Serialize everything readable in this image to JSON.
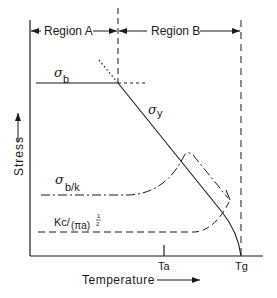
{
  "diagram": {
    "type": "stress-temperature schematic",
    "regions": [
      {
        "label": "Region A"
      },
      {
        "label": "Region B"
      }
    ],
    "axes": {
      "y_label": "Stress",
      "x_label": "Temperature",
      "x_ticks": [
        "Ta",
        "Tg"
      ]
    },
    "curves": [
      {
        "id": "sigma_b",
        "label_main": "σ",
        "label_sub": "b",
        "style": "solid"
      },
      {
        "id": "sigma_y",
        "label_main": "σ",
        "label_sub": "y",
        "style": "solid"
      },
      {
        "id": "sigma_bk",
        "label_main": "σ",
        "label_sub": "b/k",
        "style": "dash-dot"
      },
      {
        "id": "kc",
        "label_main": "Kc/",
        "label_paren": "(πa)",
        "label_exp": "1/2",
        "label_exp_num": "1",
        "label_exp_den": "2",
        "style": "dashed"
      }
    ],
    "colors": {
      "ink": "#1a1a1a",
      "background": "#ffffff"
    }
  }
}
